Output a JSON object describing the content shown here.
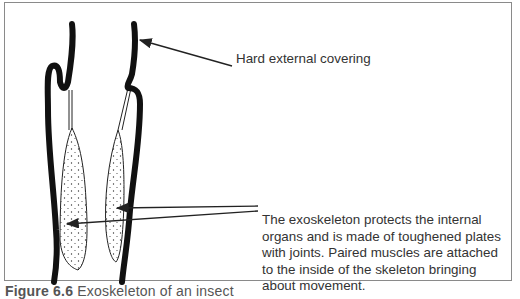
{
  "figure": {
    "labels": {
      "top": "Hard external covering",
      "bottom": "The exoskeleton protects the internal organs and is made of toughened plates with joints. Paired muscles are attached to the inside of the skeleton bringing about movement."
    },
    "caption": {
      "number": "Figure 6.6",
      "text": "Exoskeleton of an insect"
    }
  }
}
